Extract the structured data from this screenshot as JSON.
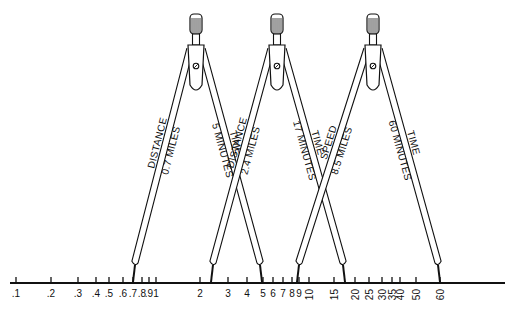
{
  "scale": {
    "line": {
      "x1": 10,
      "x2": 505,
      "y": 283
    },
    "ticks": [
      {
        "label": ".1",
        "x": 16,
        "rotated": false
      },
      {
        "label": ".2",
        "x": 51,
        "rotated": false
      },
      {
        "label": ".3",
        "x": 78,
        "rotated": false
      },
      {
        "label": ".4",
        "x": 96,
        "rotated": false
      },
      {
        "label": ".5",
        "x": 109,
        "rotated": false
      },
      {
        "label": ".6",
        "x": 123,
        "rotated": false
      },
      {
        "label": ".7",
        "x": 133,
        "rotated": false
      },
      {
        "label": ".8",
        "x": 142,
        "rotated": false
      },
      {
        "label": ".9",
        "x": 149,
        "rotated": false
      },
      {
        "label": "1",
        "x": 156,
        "rotated": false
      },
      {
        "label": "2",
        "x": 200,
        "rotated": false
      },
      {
        "label": "3",
        "x": 228,
        "rotated": false
      },
      {
        "label": "4",
        "x": 247,
        "rotated": false
      },
      {
        "label": "5",
        "x": 263,
        "rotated": false
      },
      {
        "label": "6",
        "x": 273,
        "rotated": false
      },
      {
        "label": "7",
        "x": 283,
        "rotated": false
      },
      {
        "label": "8",
        "x": 292,
        "rotated": false
      },
      {
        "label": "9",
        "x": 299,
        "rotated": false
      },
      {
        "label": "10",
        "x": 309,
        "rotated": true
      },
      {
        "label": "15",
        "x": 334,
        "rotated": true
      },
      {
        "label": "20",
        "x": 355,
        "rotated": true
      },
      {
        "label": "25",
        "x": 369,
        "rotated": true
      },
      {
        "label": "30",
        "x": 382,
        "rotated": true
      },
      {
        "label": "35",
        "x": 392,
        "rotated": true
      },
      {
        "label": "40",
        "x": 400,
        "rotated": true
      },
      {
        "label": "50",
        "x": 416,
        "rotated": true
      },
      {
        "label": "60",
        "x": 440,
        "rotated": true
      }
    ]
  },
  "dividers": [
    {
      "name": "distance-time-divider",
      "head_x": 196,
      "left_leg": {
        "foot_x": 133,
        "label_top": "DISTANCE",
        "label_bottom": "0.7 MILES"
      },
      "right_leg": {
        "foot_x": 262,
        "label_top": "TIME",
        "label_bottom": "5 MINUTES"
      }
    },
    {
      "name": "distance-time-divider-2",
      "head_x": 277,
      "left_leg": {
        "foot_x": 211,
        "label_top": "DISTANCE",
        "label_bottom": "2.4 MILES"
      },
      "right_leg": {
        "foot_x": 345,
        "label_top": "TIME",
        "label_bottom": "17 MINUTES"
      }
    },
    {
      "name": "speed-time-divider",
      "head_x": 373,
      "left_leg": {
        "foot_x": 297,
        "label_top": "SPEED",
        "label_bottom": "8.5 MILES"
      },
      "right_leg": {
        "foot_x": 440,
        "label_top": "TIME",
        "label_bottom": "60 MINUTES"
      }
    }
  ],
  "colors": {
    "ink": "#111111",
    "paper": "#ffffff"
  }
}
